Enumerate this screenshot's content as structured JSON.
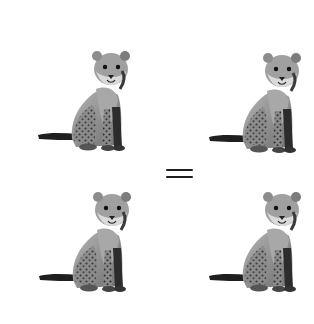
{
  "figure": {
    "type": "visual-analogy",
    "background": "#ffffff",
    "operator": {
      "symbol": "=",
      "name": "equals-sign",
      "color": "#1e1e1e"
    },
    "panels": [
      {
        "id": "top-left",
        "subject": "cheetah cub sitting",
        "style": "grayscale",
        "x": 36,
        "y": 49
      },
      {
        "id": "top-right",
        "subject": "cheetah cub sitting",
        "style": "grayscale",
        "x": 207,
        "y": 51
      },
      {
        "id": "bottom-left",
        "subject": "cheetah cub sitting",
        "style": "grayscale",
        "x": 37,
        "y": 190
      },
      {
        "id": "bottom-right",
        "subject": "cheetah cub sitting",
        "style": "grayscale",
        "x": 207,
        "y": 190
      }
    ]
  }
}
